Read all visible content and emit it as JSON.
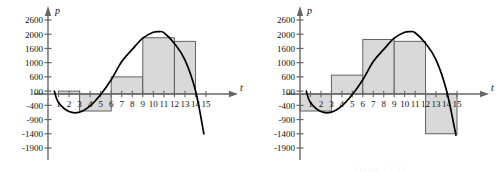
{
  "figure": {
    "caption_left": "",
    "caption_right": "Figure 13.25",
    "bar_fill": "#d9d9d9",
    "bar_stroke": "#555555",
    "curve_color": "#000000",
    "axis_color": "#666666",
    "background": "#ffffff"
  },
  "chart_data": [
    {
      "id": "left",
      "type": "bar",
      "title": "",
      "xlabel": "t",
      "ylabel": "p",
      "grid": false,
      "legend": "none",
      "axis_label_x": "t",
      "axis_label_y": "p",
      "ylim": [
        -1900,
        2600
      ],
      "xlim": [
        0,
        15
      ],
      "ytick_labels": [
        "2600",
        "2000",
        "1600",
        "1000",
        "600",
        "100",
        "-400",
        "-900",
        "-1400",
        "-1900"
      ],
      "ytick_values": [
        2600,
        2000,
        1600,
        1000,
        600,
        100,
        -400,
        -900,
        -1400,
        -1900
      ],
      "xtick_labels": [
        "1",
        "2",
        "3",
        "4",
        "5",
        "6",
        "7",
        "8",
        "9",
        "10",
        "11",
        "12",
        "13",
        "14",
        "15"
      ],
      "xtick_values": [
        1,
        2,
        3,
        4,
        5,
        6,
        7,
        8,
        9,
        10,
        11,
        12,
        13,
        14,
        15
      ],
      "bars": [
        {
          "x0": 1,
          "x1": 3,
          "value": 100
        },
        {
          "x0": 3,
          "x1": 6,
          "value": -600
        },
        {
          "x0": 6,
          "x1": 9,
          "value": 600
        },
        {
          "x0": 9,
          "x1": 12,
          "value": 1900
        },
        {
          "x0": 12,
          "x1": 14,
          "value": 1800
        }
      ],
      "curve": {
        "name": "p(t)",
        "x": [
          0.6,
          1,
          2,
          3,
          4,
          5,
          6,
          7,
          8,
          9,
          10,
          10.5,
          11,
          12,
          13,
          14,
          14.8
        ],
        "y": [
          100,
          -300,
          -620,
          -640,
          -420,
          -20,
          500,
          1050,
          1560,
          1890,
          2080,
          2110,
          2060,
          1740,
          1120,
          120,
          -1400
        ]
      }
    },
    {
      "id": "right",
      "type": "bar",
      "title": "",
      "xlabel": "t",
      "ylabel": "p",
      "grid": false,
      "legend": "none",
      "axis_label_x": "t",
      "axis_label_y": "p",
      "ylim": [
        -1900,
        2600
      ],
      "xlim": [
        0,
        15
      ],
      "ytick_labels": [
        "2600",
        "2000",
        "1600",
        "1000",
        "600",
        "100",
        "-400",
        "-900",
        "-1400",
        "-1900"
      ],
      "ytick_values": [
        2600,
        2000,
        1600,
        1000,
        600,
        100,
        -400,
        -900,
        -1400,
        -1900
      ],
      "xtick_labels": [
        "1",
        "2",
        "3",
        "4",
        "5",
        "6",
        "7",
        "8",
        "9",
        "10",
        "11",
        "12",
        "13",
        "14",
        "15"
      ],
      "xtick_values": [
        1,
        2,
        3,
        4,
        5,
        6,
        7,
        8,
        9,
        10,
        11,
        12,
        13,
        14,
        15
      ],
      "bars": [
        {
          "x0": 0,
          "x1": 3,
          "value": -600
        },
        {
          "x0": 3,
          "x1": 6,
          "value": 650
        },
        {
          "x0": 6,
          "x1": 9,
          "value": 1850
        },
        {
          "x0": 9,
          "x1": 12,
          "value": 1800
        },
        {
          "x0": 12,
          "x1": 15,
          "value": -1400
        }
      ],
      "curve": {
        "name": "p(t)",
        "x": [
          0.6,
          1,
          2,
          3,
          4,
          5,
          6,
          7,
          8,
          9,
          10,
          10.5,
          11,
          12,
          13,
          14,
          14.9
        ],
        "y": [
          100,
          -300,
          -620,
          -640,
          -420,
          -20,
          500,
          1050,
          1560,
          1890,
          2080,
          2110,
          2060,
          1740,
          1120,
          120,
          -1450
        ]
      }
    }
  ]
}
